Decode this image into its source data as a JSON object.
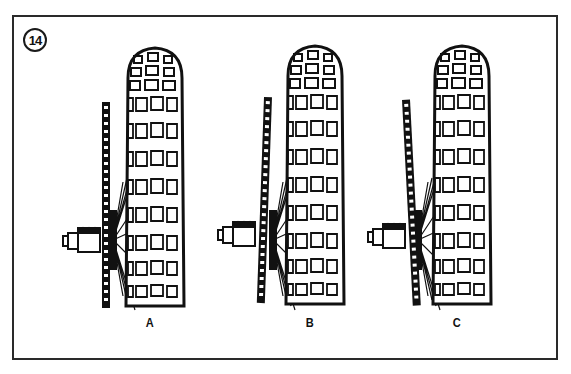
{
  "figure": {
    "number": "14",
    "panels": [
      {
        "label": "A",
        "chain_alignment": "straight"
      },
      {
        "label": "B",
        "chain_alignment": "tilted-inward"
      },
      {
        "label": "C",
        "chain_alignment": "tilted-outward"
      }
    ],
    "colors": {
      "ink": "#111111",
      "paper": "#ffffff",
      "frame": "#2a2a2a"
    }
  }
}
